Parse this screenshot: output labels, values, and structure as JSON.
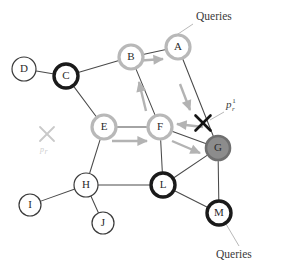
{
  "figure": {
    "width": 283,
    "height": 264,
    "background": "#ffffff"
  },
  "palette": {
    "edge": "#4a4a4a",
    "node_fill": "#ffffff",
    "ring_thin_black": "#3a3a3a",
    "ring_thick_black": "#1a1a1a",
    "ring_gray": "#b8b8b8",
    "node_filled_gray": "#8c8c8c",
    "node_filled_gray_ring": "#6f6f6f",
    "arrow_gray": "#b3b3b3",
    "cross_black": "#141414",
    "cross_faint": "#c9c9c9",
    "leader_line": "#b0b0b0",
    "text": "#3a3a3a",
    "text_faint": "#cfcfcf"
  },
  "nodes": [
    {
      "id": "A",
      "label": "A",
      "cx": 178,
      "cy": 47,
      "r": 12,
      "style": "ring-gray",
      "ring_width": 3.2
    },
    {
      "id": "B",
      "label": "B",
      "cx": 131,
      "cy": 57,
      "r": 12,
      "style": "ring-gray",
      "ring_width": 3.2
    },
    {
      "id": "C",
      "label": "C",
      "cx": 66,
      "cy": 76,
      "r": 12,
      "style": "ring-black",
      "ring_width": 3.4
    },
    {
      "id": "D",
      "label": "D",
      "cx": 24,
      "cy": 69,
      "r": 12,
      "style": "ring-thin",
      "ring_width": 1.2
    },
    {
      "id": "E",
      "label": "E",
      "cx": 104,
      "cy": 127,
      "r": 12,
      "style": "ring-gray",
      "ring_width": 3.2
    },
    {
      "id": "F",
      "label": "F",
      "cx": 160,
      "cy": 127,
      "r": 12,
      "style": "ring-gray",
      "ring_width": 3.2
    },
    {
      "id": "G",
      "label": "G",
      "cx": 218,
      "cy": 148,
      "r": 12,
      "style": "filled-gray",
      "ring_width": 2.6
    },
    {
      "id": "H",
      "label": "H",
      "cx": 86,
      "cy": 185,
      "r": 12,
      "style": "ring-thin",
      "ring_width": 1.2
    },
    {
      "id": "I",
      "label": "I",
      "cx": 30,
      "cy": 205,
      "r": 11,
      "style": "ring-thin",
      "ring_width": 1.2
    },
    {
      "id": "J",
      "label": "J",
      "cx": 103,
      "cy": 223,
      "r": 11,
      "style": "ring-thin",
      "ring_width": 1.2
    },
    {
      "id": "L",
      "label": "L",
      "cx": 163,
      "cy": 185,
      "r": 12,
      "style": "ring-black",
      "ring_width": 3.4
    },
    {
      "id": "M",
      "label": "M",
      "cx": 219,
      "cy": 213,
      "r": 12,
      "style": "ring-black",
      "ring_width": 3.4
    }
  ],
  "edges": [
    {
      "from": "D",
      "to": "C"
    },
    {
      "from": "C",
      "to": "B"
    },
    {
      "from": "C",
      "to": "E"
    },
    {
      "from": "B",
      "to": "A"
    },
    {
      "from": "B",
      "to": "F"
    },
    {
      "from": "A",
      "to": "G"
    },
    {
      "from": "E",
      "to": "F"
    },
    {
      "from": "E",
      "to": "H"
    },
    {
      "from": "F",
      "to": "G"
    },
    {
      "from": "F",
      "to": "L"
    },
    {
      "from": "H",
      "to": "I"
    },
    {
      "from": "H",
      "to": "J"
    },
    {
      "from": "H",
      "to": "L"
    },
    {
      "from": "L",
      "to": "G"
    },
    {
      "from": "L",
      "to": "M"
    },
    {
      "from": "G",
      "to": "M"
    }
  ],
  "flow_arrows": [
    {
      "name": "arrow-b-to-a",
      "x1": 134,
      "y1": 61,
      "x2": 163,
      "y2": 59
    },
    {
      "name": "arrow-f-to-b",
      "x1": 146,
      "y1": 111,
      "x2": 139,
      "y2": 82
    },
    {
      "name": "arrow-a-to-g",
      "x1": 180,
      "y1": 84,
      "x2": 190,
      "y2": 110
    },
    {
      "name": "arrow-g-to-f",
      "x1": 203,
      "y1": 127,
      "x2": 177,
      "y2": 124
    },
    {
      "name": "arrow-e-to-f",
      "x1": 112,
      "y1": 141,
      "x2": 147,
      "y2": 141
    },
    {
      "name": "arrow-f-to-g",
      "x1": 172,
      "y1": 141,
      "x2": 200,
      "y2": 153
    }
  ],
  "crosses": [
    {
      "name": "cross-failed-peer",
      "cx": 203,
      "cy": 123,
      "size": 7.5,
      "color_key": "cross_black",
      "stroke": 2.6
    },
    {
      "name": "cross-faint-peer",
      "cx": 47,
      "cy": 134,
      "size": 7.0,
      "color_key": "cross_faint",
      "stroke": 1.8
    }
  ],
  "annotations": {
    "queries_top": {
      "text": "Queries",
      "x": 196,
      "y": 20,
      "leader": {
        "x1": 193,
        "y1": 24,
        "x2": 172,
        "y2": 38
      }
    },
    "queries_bottom": {
      "text": "Queries",
      "x": 216,
      "y": 258,
      "leader": {
        "x1": 226,
        "y1": 224,
        "x2": 239,
        "y2": 246
      }
    },
    "p_r_one": {
      "base": "p",
      "sub": "r",
      "sup": "1",
      "x": 226,
      "y": 108,
      "leader": {
        "x1": 224,
        "y1": 112,
        "x2": 210,
        "y2": 120
      }
    },
    "p_r_faint": {
      "base": "p",
      "sub": "r",
      "x": 40,
      "y": 152
    }
  }
}
